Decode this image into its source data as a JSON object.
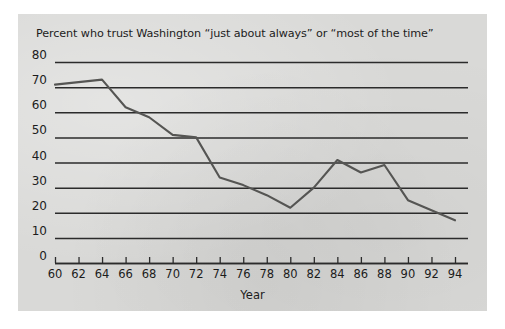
{
  "figure": {
    "background_color": "#ffffff",
    "panel_color": "#d9d9d7",
    "line_color": "#555553",
    "axis_color": "#2b2b2b"
  },
  "chart_data": {
    "type": "line",
    "title": "Percent who trust Washington “just about always” or “most of the time”",
    "xlabel": "Year",
    "ylabel": "",
    "xlim": [
      60,
      94
    ],
    "ylim": [
      0,
      80
    ],
    "grid": true,
    "legend": false,
    "x_tick_labels": [
      "60",
      "62",
      "64",
      "66",
      "68",
      "70",
      "72",
      "74",
      "76",
      "78",
      "80",
      "82",
      "84",
      "86",
      "88",
      "90",
      "92",
      "94"
    ],
    "y_tick_labels": [
      "0",
      "10",
      "20",
      "30",
      "40",
      "50",
      "60",
      "70",
      "80"
    ],
    "x": [
      60,
      62,
      64,
      66,
      68,
      70,
      72,
      74,
      76,
      78,
      80,
      82,
      84,
      86,
      88,
      90,
      92,
      94
    ],
    "values": [
      71,
      72,
      73,
      62,
      58,
      51,
      50,
      34,
      31,
      27,
      22,
      30,
      41,
      36,
      39,
      25,
      21,
      17
    ],
    "series": [
      {
        "name": "Percent who trust Washington",
        "values": [
          71,
          72,
          73,
          62,
          58,
          51,
          50,
          34,
          31,
          27,
          22,
          30,
          41,
          36,
          39,
          25,
          21,
          17
        ]
      }
    ]
  }
}
